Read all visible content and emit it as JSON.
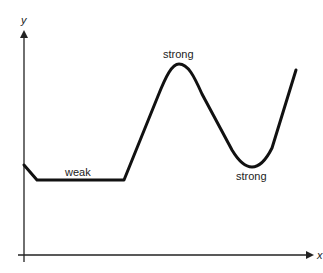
{
  "diagram": {
    "axes": {
      "x_label": "x",
      "y_label": "y"
    },
    "annotations": {
      "weak": "weak",
      "strong_peak": "strong",
      "strong_trough": "strong"
    },
    "colors": {
      "curve": "#111111",
      "axis": "#222222",
      "text": "#222222",
      "background": "#ffffff"
    }
  }
}
